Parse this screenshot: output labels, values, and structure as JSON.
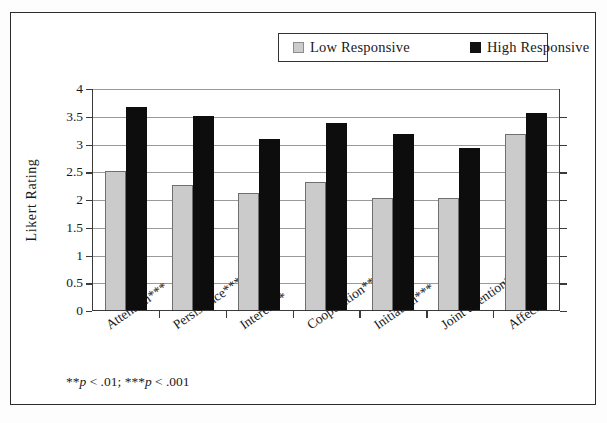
{
  "chart_data": {
    "type": "bar",
    "title": "",
    "xlabel": "",
    "ylabel": "Likert Rating",
    "ylim": [
      0,
      4
    ],
    "ytick_step": 0.5,
    "yticks": [
      "0",
      "0.5",
      "1",
      "1.5",
      "2",
      "2.5",
      "3",
      "3.5",
      "4"
    ],
    "grid": true,
    "legend_position": "top-center",
    "categories": [
      "Attention***",
      "Persistence***",
      "Interest**",
      "Cooperation**",
      "Initiation***",
      "Joint attention**",
      "Affect"
    ],
    "series": [
      {
        "name": "Low Responsive",
        "color": "#cbcbcb",
        "values": [
          2.5,
          2.25,
          2.1,
          2.3,
          2.02,
          2.02,
          3.18
        ]
      },
      {
        "name": "High Responsive",
        "color": "#0d0d0d",
        "values": [
          3.66,
          3.5,
          3.09,
          3.37,
          3.18,
          2.92,
          3.55
        ]
      }
    ],
    "annotations": [
      "**p < .01; ***p < .001"
    ]
  },
  "legend": {
    "low_label": "Low Responsive",
    "high_label": "High Responsive"
  },
  "footnote": {
    "stars_1": "**",
    "p_1": "p",
    "text_1": " < .01; ",
    "stars_2": "***",
    "p_2": "p",
    "text_2": " < .001"
  }
}
